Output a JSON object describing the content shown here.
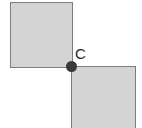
{
  "figure": {
    "type": "geometry-diagram",
    "background_color": "#ffffff",
    "shapes": [
      {
        "id": "square-top-left",
        "name": "top-left-square",
        "fill_color": "#d4d4d4",
        "stroke_color": "#7d7d7d"
      },
      {
        "id": "square-bottom-right",
        "name": "bottom-right-square",
        "fill_color": "#d4d4d4",
        "stroke_color": "#7d7d7d"
      }
    ],
    "point": {
      "label": "C",
      "color": "#3a3a3a",
      "label_color": "#262626"
    }
  }
}
